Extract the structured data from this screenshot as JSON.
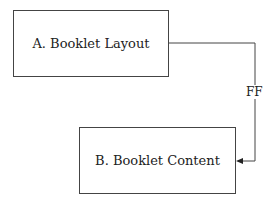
{
  "diagram": {
    "nodes": [
      {
        "id": "A",
        "label": "A. Booklet Layout"
      },
      {
        "id": "B",
        "label": "B. Booklet Content"
      }
    ],
    "edges": [
      {
        "from": "A",
        "to": "B",
        "label": "FF"
      }
    ]
  }
}
